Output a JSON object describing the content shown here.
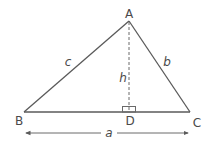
{
  "diagram": {
    "type": "triangle-altitude",
    "colors": {
      "line": "#5a5a5a",
      "text": "#4a4a4a",
      "background": "#ffffff"
    },
    "vertices": {
      "A": {
        "label": "A",
        "x": 129,
        "y": 21
      },
      "B": {
        "label": "B",
        "x": 24,
        "y": 112
      },
      "C": {
        "label": "C",
        "x": 190,
        "y": 112
      },
      "D": {
        "label": "D",
        "x": 129,
        "y": 112
      }
    },
    "sides": {
      "a": "a",
      "b": "b",
      "c": "c"
    },
    "altitude": {
      "label": "h",
      "from": "A",
      "to": "D",
      "style": "dashed",
      "right_angle_marker": true
    },
    "dimension": {
      "label": "a",
      "from": "B",
      "to": "C",
      "arrows": "both"
    }
  }
}
